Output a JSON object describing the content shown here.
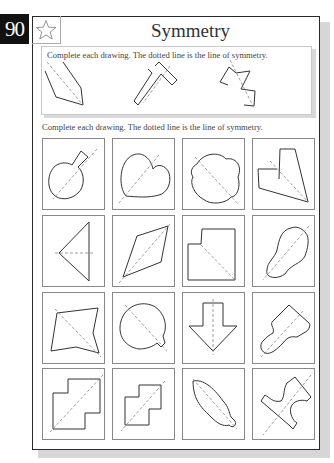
{
  "page": {
    "number": "90",
    "title": "Symmetry",
    "icon": "star-icon"
  },
  "example_section": {
    "instruction": "Complete each drawing. The dotted line is the line of symmetry.",
    "shapes": [
      "kite-half",
      "t-shape-half",
      "zigzag-half"
    ]
  },
  "exercise_section": {
    "instruction": "Complete each drawing. The dotted line is the line of symmetry.",
    "rows": [
      [
        "keyhole-half",
        "heart-half",
        "clover-half",
        "l-shape-half"
      ],
      [
        "triangle-half",
        "diamond-half",
        "notched-square-half",
        "peanut-half"
      ],
      [
        "quadrilateral-half",
        "round-tab-half",
        "arrow-down-half",
        "paddle-half"
      ],
      [
        "steps-large-half",
        "steps-small-half",
        "leaf-half",
        "puzzle-piece-half"
      ]
    ]
  },
  "colors": {
    "page_num_bg": "#111111",
    "frame_border": "#2a2a2a",
    "cell_border": "#888888",
    "line": "#333333",
    "symmetry_line": "#888888"
  }
}
